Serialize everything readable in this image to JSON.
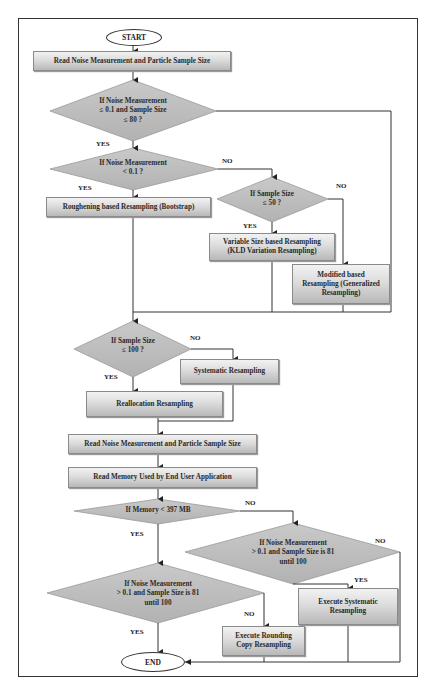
{
  "flowchart": {
    "start": "START",
    "end": "END",
    "steps": {
      "read1": "Read Noise Measurement and Particle Sample Size",
      "roughening": "Roughening based Resampling (Bootstrap)",
      "variable": "Variable Size based Resampling (KLD Variation Resampling)",
      "variable_l1": "Variable Size based Resampling",
      "variable_l2": "(KLD Variation Resampling)",
      "modified_l1": "Modified based",
      "modified_l2": "Resampling (Generalized",
      "modified_l3": "Resampling)",
      "systematic": "Systematic Resampling",
      "reallocation": "Reallocation Resampling",
      "read2": "Read Noise Measurement and Particle Sample Size",
      "read_memory": "Read Memory Used by End User Application",
      "exec_systematic_l1": "Execute Systematic",
      "exec_systematic_l2": "Resampling",
      "exec_rounding_l1": "Execute Rounding",
      "exec_rounding_l2": "Copy Resampling"
    },
    "decisions": {
      "d1_l1": "If Noise Measurement",
      "d1_l2": "≤ 0.1 and Sample Size",
      "d1_l3": "≤ 80 ?",
      "d2_l1": "If Noise Measurement",
      "d2_l2": "< 0.1 ?",
      "d3_l1": "If Sample Size",
      "d3_l2": "≤ 50 ?",
      "d4_l1": "If Sample Size",
      "d4_l2": "≤ 100 ?",
      "d5": "If Memory < 397 MB",
      "d6_l1": "If Noise Measurement",
      "d6_l2": "> 0.1 and Sample Size is 81",
      "d6_l3": "until 100",
      "d7_l1": "If Noise Measurement",
      "d7_l2": "> 0.1 and Sample Size is 81",
      "d7_l3": "until 100"
    },
    "labels": {
      "yes": "YES",
      "no": "NO"
    },
    "colors": {
      "diamond_fill": "#bdbdbd",
      "line": "#333333"
    }
  }
}
